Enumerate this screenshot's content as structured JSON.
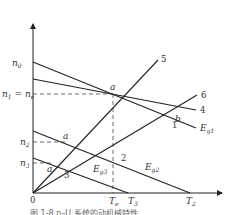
{
  "figure": {
    "caption": "图 1-8  n–U 系统的动机械特性",
    "axes": {
      "origin_label": "0",
      "y_ticks": {
        "n0": "n",
        "n0_sub": "0",
        "n1": "n",
        "n1_sub": "1",
        "eq": " = ",
        "ne": "n",
        "ne_sub": "e",
        "n2": "n",
        "n2_sub": "2",
        "n3": "n",
        "n3_sub": "3"
      },
      "x_ticks": {
        "Te": "T",
        "Te_sub": "e",
        "T3": "T",
        "T3_sub": "3",
        "T2": "T",
        "T2_sub": "2"
      }
    },
    "curves": {
      "c1": "1",
      "c2": "2",
      "c3": "3",
      "c4": "4",
      "c5": "5",
      "c6": "6",
      "Eg1": "E",
      "Eg1_sub": "g1",
      "Eg2": "E",
      "Eg2_sub": "g2",
      "Eg3": "E",
      "Eg3_sub": "g3"
    },
    "points": {
      "a_main": "a",
      "a_n2": "a",
      "a_prime": "a′",
      "b": "b"
    }
  }
}
